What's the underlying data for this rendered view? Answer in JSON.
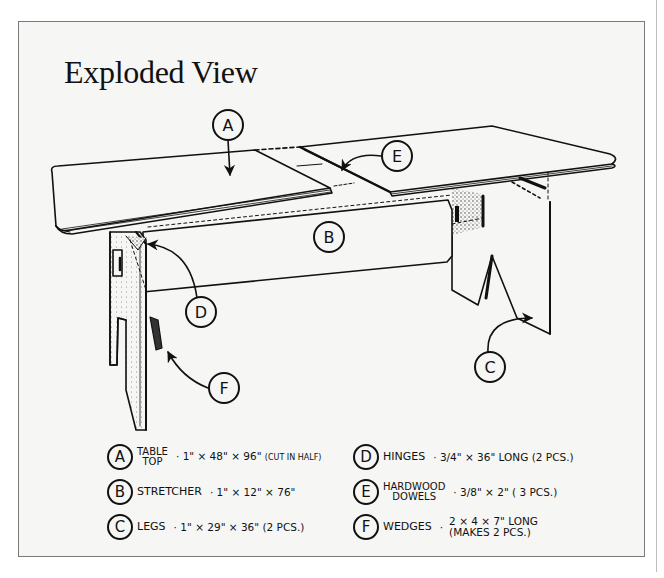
{
  "title": "Exploded View",
  "callouts": [
    {
      "letter": "A",
      "x": 228,
      "y": 125
    },
    {
      "letter": "B",
      "x": 329,
      "y": 237
    },
    {
      "letter": "C",
      "x": 490,
      "y": 367
    },
    {
      "letter": "D",
      "x": 201,
      "y": 312
    },
    {
      "letter": "E",
      "x": 397,
      "y": 156
    },
    {
      "letter": "F",
      "x": 224,
      "y": 388
    }
  ],
  "legend": [
    {
      "letter": "A",
      "name_line1": "TABLE",
      "name_line2": "TOP",
      "spec": "1\" × 48\" × 96\"",
      "note": "(CUT IN HALF)"
    },
    {
      "letter": "B",
      "name": "STRETCHER",
      "spec": "1\" × 12\" × 76\""
    },
    {
      "letter": "C",
      "name": "LEGS",
      "spec": "1\" × 29\" × 36\" (2 PCS.)"
    },
    {
      "letter": "D",
      "name": "HINGES",
      "spec": "3/4\" × 36\" LONG (2 PCS.)"
    },
    {
      "letter": "E",
      "name_line1": "HARDWOOD",
      "name_line2": "DOWELS",
      "spec": "3/8\" × 2\" ( 3 PCS.)"
    },
    {
      "letter": "F",
      "name": "WEDGES",
      "spec_line1": "2 × 4 × 7\" LONG",
      "spec_line2": "(MAKES 2 PCS.)"
    }
  ],
  "separator": "·"
}
